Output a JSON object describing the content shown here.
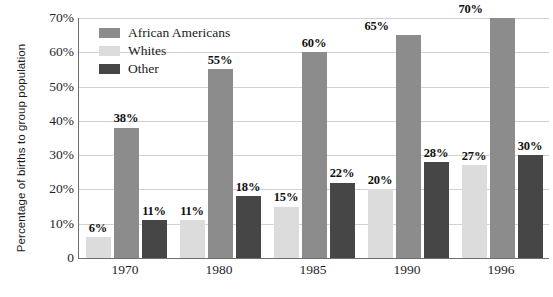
{
  "chart_data": {
    "type": "bar",
    "title": "",
    "xlabel": "",
    "ylabel": "Percentage of births to group population",
    "categories": [
      "1970",
      "1980",
      "1985",
      "1990",
      "1996"
    ],
    "series": [
      {
        "name": "Whites",
        "color": "#dcdcdc",
        "values": [
          6,
          11,
          15,
          20,
          27
        ],
        "labels": [
          "6%",
          "11%",
          "15%",
          "20%",
          "27%"
        ]
      },
      {
        "name": "African Americans",
        "color": "#8c8c8c",
        "values": [
          38,
          55,
          60,
          65,
          70
        ],
        "labels": [
          "38%",
          "55%",
          "60%",
          "65%",
          "70%"
        ]
      },
      {
        "name": "Other",
        "color": "#464646",
        "values": [
          11,
          18,
          22,
          28,
          30
        ],
        "labels": [
          "11%",
          "18%",
          "22%",
          "28%",
          "30%"
        ]
      }
    ],
    "series_draw_order": [
      "Whites",
      "African Americans",
      "Other"
    ],
    "legend_order": [
      "African Americans",
      "Whites",
      "Other"
    ],
    "ylim": [
      0,
      70
    ],
    "y_ticks": [
      0,
      10,
      20,
      30,
      40,
      50,
      60,
      70
    ],
    "y_tick_labels": [
      "0",
      "10%",
      "20%",
      "30%",
      "40%",
      "50%",
      "60%",
      "70%"
    ],
    "grid": true,
    "legend_position": "top-left-inside",
    "value_labels": true
  },
  "legend": {
    "items": [
      {
        "label": "African Americans",
        "color": "#8c8c8c"
      },
      {
        "label": "Whites",
        "color": "#dcdcdc"
      },
      {
        "label": "Other",
        "color": "#464646"
      }
    ]
  },
  "axis": {
    "y_title": "Percentage of births to group population",
    "y_labels": [
      "70%",
      "60%",
      "50%",
      "40%",
      "30%",
      "20%",
      "10%",
      "0"
    ],
    "x_labels": [
      "1970",
      "1980",
      "1985",
      "1990",
      "1996"
    ]
  },
  "colors": {
    "african_americans": "#8c8c8c",
    "whites": "#dcdcdc",
    "other": "#464646",
    "gridline": "#d2d2d2",
    "axis": "#6d6d6d",
    "background": "#ffffff",
    "text": "#1b1b1b"
  }
}
